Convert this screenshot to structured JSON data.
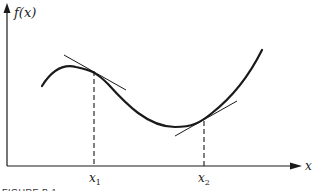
{
  "figure": {
    "caption": "FIGURE B.1",
    "y_axis_label": "f(x)",
    "x_axis_label": "x",
    "points": [
      {
        "name": "x1",
        "base": "x",
        "sub": "1"
      },
      {
        "name": "x2",
        "base": "x",
        "sub": "2"
      }
    ]
  },
  "colors": {
    "ink": "#1a1a1a",
    "background": "#ffffff"
  }
}
